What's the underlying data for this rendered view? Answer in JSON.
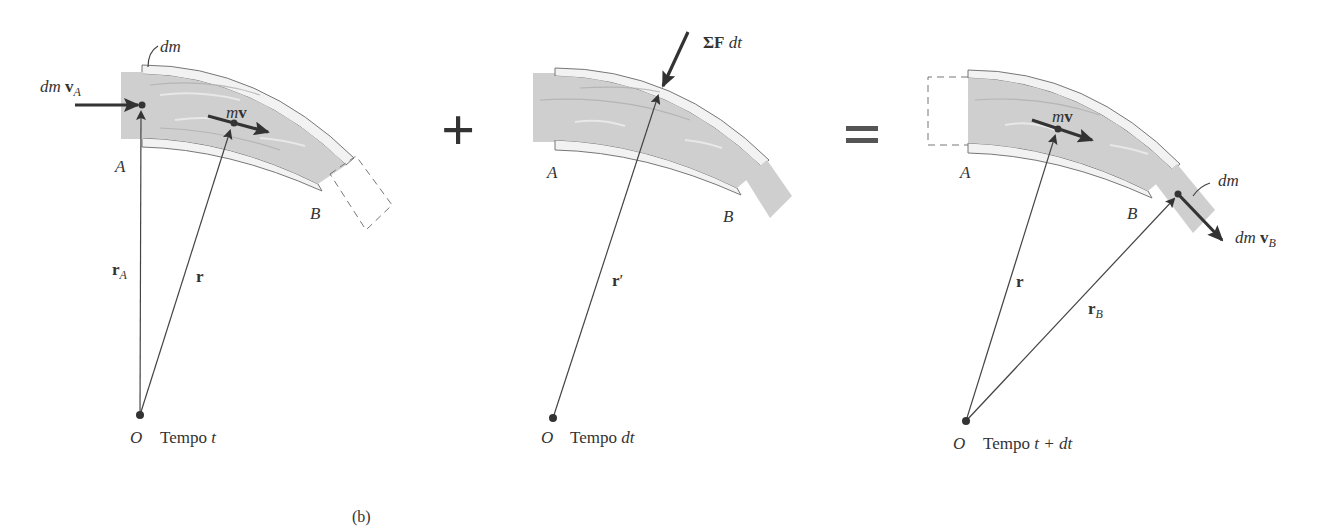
{
  "figure": {
    "caption": "(b)",
    "operators": {
      "plus": "+",
      "equals": "="
    }
  },
  "panels": [
    {
      "id": "t",
      "labels": {
        "dm": "dm",
        "dm_vA_prefix": "dm ",
        "dm_vA_vec": "v",
        "dm_vA_sub": "A",
        "mv_m": "m",
        "mv_v": "v",
        "A": "A",
        "B": "B",
        "rA_vec": "r",
        "rA_sub": "A",
        "r": "r",
        "O": "O",
        "time_prefix": "Tempo ",
        "time_var": "t"
      }
    },
    {
      "id": "dt",
      "labels": {
        "sumF_sigma": "ΣF",
        "sumF_dt": " dt",
        "A": "A",
        "B": "B",
        "r_prime": "r",
        "prime": "′",
        "O": "O",
        "time_prefix": "Tempo ",
        "time_var": "dt"
      }
    },
    {
      "id": "t_plus_dt",
      "labels": {
        "mv_m": "m",
        "mv_v": "v",
        "A": "A",
        "B": "B",
        "dm": "dm",
        "dm_vB_prefix": "dm ",
        "dm_vB_vec": "v",
        "dm_vB_sub": "B",
        "r": "r",
        "rB_vec": "r",
        "rB_sub": "B",
        "O": "O",
        "time_prefix": "Tempo ",
        "time_var": "t + dt"
      }
    }
  ]
}
